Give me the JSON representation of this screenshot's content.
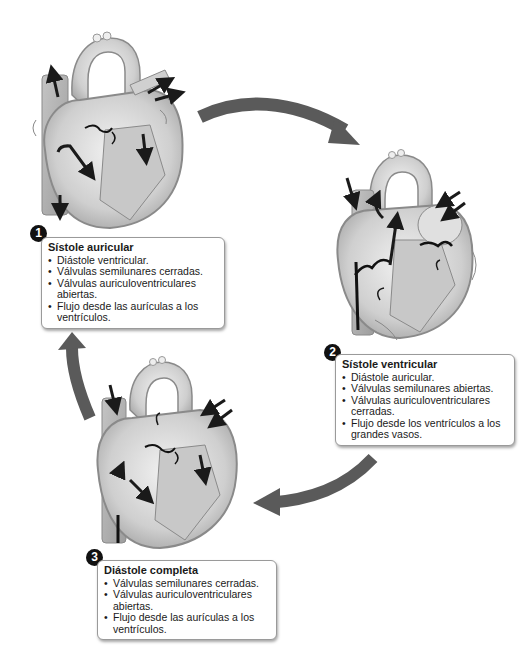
{
  "diagram": {
    "type": "cardiac-cycle",
    "colors": {
      "cycle_arrow": "#5a5a5a",
      "heart_fill": "#d6d6d6",
      "heart_outline": "#8a8a8a",
      "flow_arrow": "#1a1a1a",
      "badge": "#111111",
      "box_border": "#9a9a9a"
    },
    "phases": [
      {
        "number": "1",
        "title": "Sístole auricular",
        "bullets": [
          "Diástole ventricular.",
          "Válvulas semilunares cerradas.",
          "Válvulas auriculoventriculares abiertas.",
          "Flujo desde las aurículas a los ventrículos."
        ]
      },
      {
        "number": "2",
        "title": "Sístole ventricular",
        "bullets": [
          "Diástole auricular.",
          "Válvulas semilunares abiertas.",
          "Válvulas auriculoventriculares cerradas.",
          "Flujo desde los ventrículos a los grandes vasos."
        ]
      },
      {
        "number": "3",
        "title": "Diástole completa",
        "bullets": [
          "Válvulas semilunares cerradas.",
          "Válvulas auriculoventriculares abiertas.",
          "Flujo desde las aurículas a los ventrículos."
        ]
      }
    ],
    "cycle_arrows": [
      "phase1-to-phase2",
      "phase2-to-phase3",
      "phase3-to-phase1"
    ]
  }
}
